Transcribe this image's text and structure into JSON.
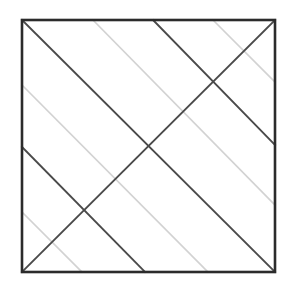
{
  "figure": {
    "canvas": {
      "width": 294,
      "height": 287,
      "background": "#ffffff"
    },
    "square": {
      "name": "outer-square",
      "x": 22,
      "y": 20,
      "width": 253,
      "height": 252,
      "stroke": "#2b2b2b",
      "stroke_width": 2.6,
      "fill": "none"
    },
    "colors": {
      "dark_line": "#4a4a4a",
      "darker_line": "#2b2b2b",
      "light_line": "#d2d2d2",
      "background": "#ffffff"
    },
    "stroke_widths": {
      "dark": 1.9,
      "light": 1.6
    },
    "dark_lines": [
      {
        "name": "main-diagonal-top-left-to-bottom-right",
        "x1": 22,
        "y1": 20,
        "x2": 275,
        "y2": 272
      },
      {
        "name": "anti-diagonal-top-right-to-bottom-left",
        "x1": 275,
        "y1": 20,
        "x2": 22,
        "y2": 272
      },
      {
        "name": "dark-parallel-diagonal-upper",
        "x1": 153,
        "y1": 20,
        "x2": 275,
        "y2": 145
      },
      {
        "name": "dark-parallel-diagonal-lower",
        "x1": 22,
        "y1": 147,
        "x2": 145,
        "y2": 272
      }
    ],
    "light_lines": [
      {
        "name": "light-diagonal-1",
        "x1": 93,
        "y1": 20,
        "x2": 275,
        "y2": 205
      },
      {
        "name": "light-diagonal-2",
        "x1": 213,
        "y1": 20,
        "x2": 275,
        "y2": 82
      },
      {
        "name": "light-diagonal-3",
        "x1": 22,
        "y1": 85,
        "x2": 208,
        "y2": 272
      },
      {
        "name": "light-diagonal-4",
        "x1": 22,
        "y1": 212,
        "x2": 82,
        "y2": 272
      }
    ]
  }
}
